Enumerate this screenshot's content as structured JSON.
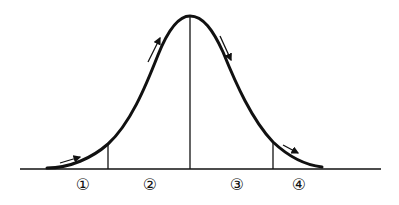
{
  "diagram": {
    "type": "bell-curve",
    "colors": {
      "line": "#111111",
      "background": "#ffffff"
    },
    "regions": [
      {
        "id": 1,
        "label": "①"
      },
      {
        "id": 2,
        "label": "②"
      },
      {
        "id": 3,
        "label": "③"
      },
      {
        "id": 4,
        "label": "④"
      }
    ],
    "arrows": [
      {
        "region": 1,
        "direction": "up-right"
      },
      {
        "region": 2,
        "direction": "up-right"
      },
      {
        "region": 3,
        "direction": "down-right"
      },
      {
        "region": 4,
        "direction": "down-right"
      }
    ]
  }
}
